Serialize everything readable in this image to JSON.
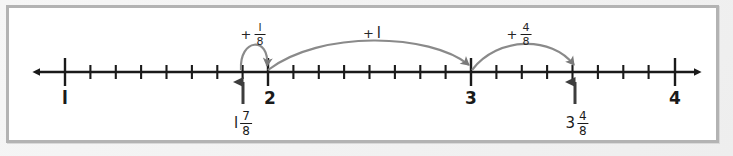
{
  "figure": {
    "frame_color": "#b3b3b3",
    "background_color": "#ffffff",
    "line_color": "#1a1a1a",
    "arc_color": "#8a8a8a",
    "arrow_marker_color": "#7a7a7a"
  },
  "number_line": {
    "axis_y": 72,
    "left_arrow_x": 32,
    "right_arrow_x": 702,
    "tick_spacing_px": 25.4,
    "minor_ticks_per_unit": 8,
    "major_ticks": [
      {
        "value": "1",
        "label": "l",
        "x": 65
      },
      {
        "value": "2",
        "label": "2",
        "x": 268
      },
      {
        "value": "3",
        "label": "3",
        "x": 471
      },
      {
        "value": "4",
        "label": "4",
        "x": 675
      }
    ]
  },
  "jumps": [
    {
      "id": "jump-one-eighth",
      "plus": "+",
      "numerator": "l",
      "denominator": "8",
      "from_x": 243,
      "to_x": 268,
      "label_x": 253,
      "label_y": 22,
      "apex_y": 46
    },
    {
      "id": "jump-one-whole",
      "plus": "+",
      "whole": "l",
      "from_x": 268,
      "to_x": 471,
      "label_x": 372,
      "label_y": 25,
      "apex_y": 44
    },
    {
      "id": "jump-four-eighths",
      "plus": "+",
      "numerator": "4",
      "denominator": "8",
      "from_x": 471,
      "to_x": 575,
      "label_x": 519,
      "label_y": 22,
      "apex_y": 46
    }
  ],
  "marked_points": [
    {
      "id": "point-start",
      "whole": "l",
      "numerator": "7",
      "denominator": "8",
      "x": 243,
      "arrow_tip_y": 78,
      "arrow_tail_y": 104,
      "label_y": 110
    },
    {
      "id": "point-end",
      "whole": "3",
      "numerator": "4",
      "denominator": "8",
      "x": 575,
      "arrow_tip_y": 78,
      "arrow_tail_y": 104,
      "label_y": 110
    }
  ]
}
